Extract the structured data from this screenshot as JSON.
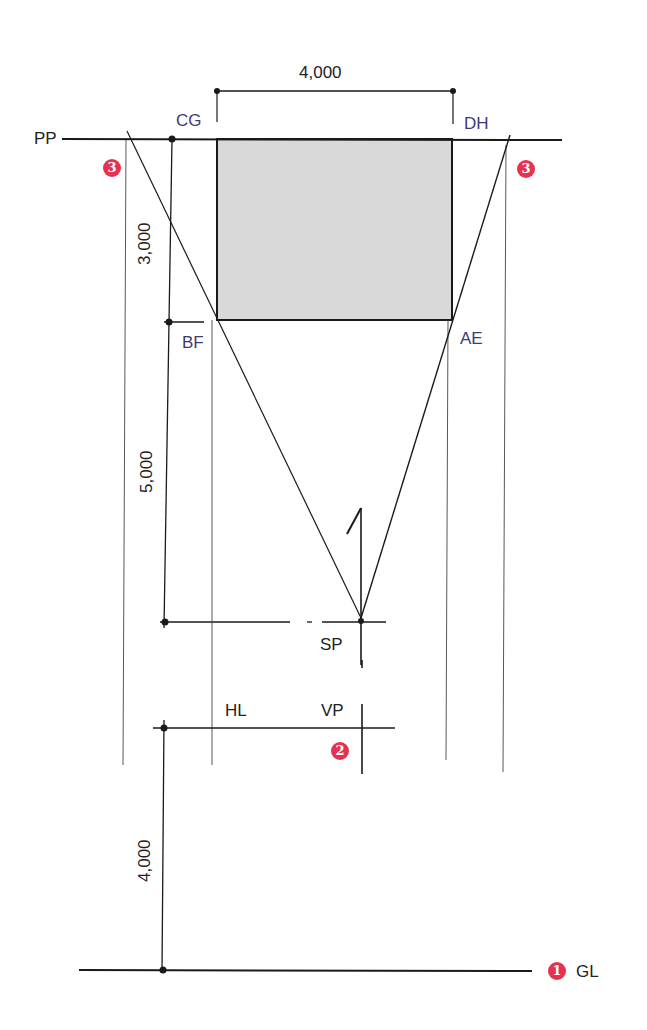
{
  "diagram": {
    "type": "perspective-plan-setup",
    "colors": {
      "line": "#1a1a1a",
      "fill": "#d9d9d9",
      "point_label": "#3d3a78",
      "badge": "#e8304f"
    },
    "lines": {
      "picture_plane": "PP",
      "horizon_line": "HL",
      "ground_line": "GL"
    },
    "points": {
      "station_point": "SP",
      "vanishing_point": "VP",
      "corner_cg": "CG",
      "corner_dh": "DH",
      "corner_bf": "BF",
      "corner_ae": "AE"
    },
    "dimensions": {
      "width": "4,000",
      "depth": "3,000",
      "distance_to_sp": "5,000",
      "eye_height": "4,000"
    },
    "badges": {
      "ground_line_step": "1",
      "vp_step": "2",
      "left_projection_step": "3",
      "right_projection_step": "3"
    }
  }
}
